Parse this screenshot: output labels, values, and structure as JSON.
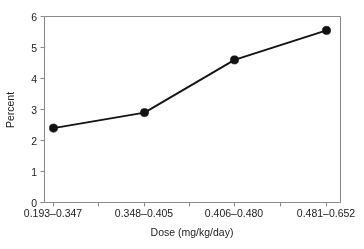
{
  "chart_data": {
    "type": "line",
    "title": "",
    "xlabel": "Dose (mg/kg/day)",
    "ylabel": "Percent",
    "categories": [
      "0.193–0.347",
      "0.348–0.405",
      "0.406–0.480",
      "0.481–0.652"
    ],
    "values": [
      2.4,
      2.9,
      4.6,
      5.55
    ],
    "series": [
      {
        "name": "Percent",
        "values": [
          2.4,
          2.9,
          4.6,
          5.55
        ]
      }
    ],
    "ylim": [
      0,
      6
    ],
    "yticks": [
      0,
      1,
      2,
      3,
      4,
      5,
      6
    ],
    "ytick_labels": [
      "0",
      "1",
      "2",
      "3",
      "4",
      "5",
      "6"
    ],
    "grid": false,
    "legend": "none",
    "marker": "filled-circle",
    "line_color": "#141414",
    "marker_color": "#121212",
    "frame_color": "#8a8a8a",
    "background": "#ffffff"
  },
  "axes": {
    "y_title": "Percent",
    "x_title": "Dose (mg/kg/day)",
    "y_tick_labels": [
      "6",
      "5",
      "4",
      "3",
      "2",
      "1",
      "0"
    ],
    "x_tick_labels": [
      "0.193–0.347",
      "0.348–0.405",
      "0.406–0.480",
      "0.481–0.652"
    ]
  }
}
